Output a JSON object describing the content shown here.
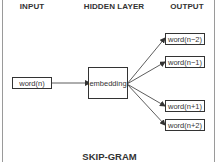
{
  "diagram": {
    "title": "SKIP-GRAM",
    "headers": {
      "input": "INPUT",
      "hidden": "HIDDEN LAYER",
      "output": "OUTPUT"
    },
    "input_node": {
      "label": "word(n)"
    },
    "hidden_node": {
      "label": "embedding"
    },
    "output_nodes": [
      {
        "label": "word(n−2)"
      },
      {
        "label": "word(n−1)"
      },
      {
        "label": "word(n+1)"
      },
      {
        "label": "word(n+2)"
      }
    ],
    "edges": [
      {
        "from": "word(n)",
        "to": "embedding"
      },
      {
        "from": "embedding",
        "to": "word(n−2)"
      },
      {
        "from": "embedding",
        "to": "word(n−1)"
      },
      {
        "from": "embedding",
        "to": "word(n+1)"
      },
      {
        "from": "embedding",
        "to": "word(n+2)"
      }
    ]
  }
}
